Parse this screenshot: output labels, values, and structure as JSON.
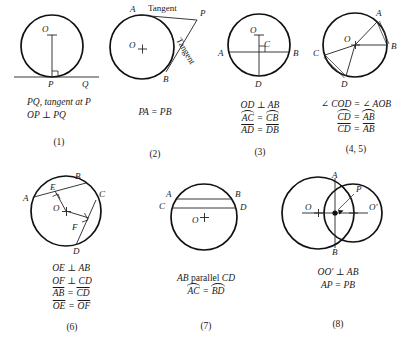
{
  "sheet": {
    "title": "Circle theorems reference figures"
  },
  "panels": [
    {
      "id": "panel-1",
      "number": "(1)",
      "point_labels": {
        "center": "O",
        "p": "P",
        "q": "Q"
      },
      "caption_lines": [
        "PQ, tangent at P",
        "OP ⊥ PQ"
      ],
      "icon": "circle-with-tangent-line"
    },
    {
      "id": "panel-2",
      "number": "(2)",
      "point_labels": {
        "center": "O",
        "a": "A",
        "b": "B",
        "p": "P"
      },
      "annotations": {
        "tangent_top": "Tangent",
        "tangent_lower": "Tangent"
      },
      "caption_lines": [
        "PA = PB"
      ],
      "icon": "circle-with-two-tangents"
    },
    {
      "id": "panel-3",
      "number": "(3)",
      "point_labels": {
        "center": "O",
        "a": "A",
        "b": "B",
        "c": "C",
        "d": "D"
      },
      "caption_lines": [
        "OD ⊥ AB",
        "AC = CB",
        "AD = DB"
      ],
      "icon": "circle-with-perpendicular-chord-bisector"
    },
    {
      "id": "panel-4",
      "number": "(4, 5)",
      "point_labels": {
        "center": "O",
        "a": "A",
        "b": "B",
        "c": "C",
        "d": "D"
      },
      "caption_lines": [
        "∠ COD = ∠ AOB",
        "CD = AB",
        "CD = AB"
      ],
      "icon": "circle-with-equal-central-angles"
    },
    {
      "id": "panel-6",
      "number": "(6)",
      "point_labels": {
        "center": "O",
        "a": "A",
        "b": "B",
        "c": "C",
        "d": "D",
        "e": "E",
        "f": "F"
      },
      "caption_lines": [
        "OE ⊥ AB",
        "OF ⊥ CD",
        "AB = CD",
        "OE = OF"
      ],
      "icon": "circle-with-two-equal-chords"
    },
    {
      "id": "panel-7",
      "number": "(7)",
      "point_labels": {
        "center": "O",
        "a": "A",
        "b": "B",
        "c": "C",
        "d": "D"
      },
      "caption_lines": [
        "AB parallel CD",
        "AC = BD"
      ],
      "icon": "circle-with-parallel-chords"
    },
    {
      "id": "panel-8",
      "number": "(8)",
      "point_labels": {
        "center_left": "O",
        "center_right": "O'",
        "a": "A",
        "b": "B",
        "p": "P"
      },
      "caption_lines": [
        "OO' ⊥ AB",
        "AP = PB"
      ],
      "icon": "two-intersecting-circles"
    }
  ],
  "caption_text": {
    "p1_l1": "PQ, tangent at P",
    "p1_l2": "OP ⊥ PQ",
    "p2_l1": "PA = PB",
    "p3_l1": "OD ⊥ AB",
    "p3_l2_left": "AC",
    "p3_l2_right": "CB",
    "p3_l3_left": "AD",
    "p3_l3_right": "DB",
    "p4_l1": "∠ COD = ∠ AOB",
    "p4_l2_left": "CD",
    "p4_l2_right": "AB",
    "p4_l3_left": "CD",
    "p4_l3_right": "AB",
    "p6_l1": "OE ⊥ AB",
    "p6_l2": "OF ⊥ CD",
    "p6_l3_left": "AB",
    "p6_l3_right": "CD",
    "p6_l4_left": "OE",
    "p6_l4_right": "OF",
    "p7_l1_a": "AB",
    "p7_l1_b": "parallel",
    "p7_l1_c": "CD",
    "p7_l2_left": "AC",
    "p7_l2_right": "BD",
    "p8_l1": "OO' ⊥ AB",
    "p8_l2": "AP = PB",
    "eq": "="
  },
  "numbers": {
    "n1": "(1)",
    "n2": "(2)",
    "n3": "(3)",
    "n4": "(4, 5)",
    "n6": "(6)",
    "n7": "(7)",
    "n8": "(8)"
  },
  "labels": {
    "O": "O",
    "Oprime": "O'",
    "A": "A",
    "B": "B",
    "C": "C",
    "D": "D",
    "E": "E",
    "F": "F",
    "P": "P",
    "Q": "Q",
    "tangent": "Tangent"
  },
  "colors": {
    "ink": "#1a1a1a",
    "stroke": "#111111",
    "paper": "#ffffff"
  }
}
